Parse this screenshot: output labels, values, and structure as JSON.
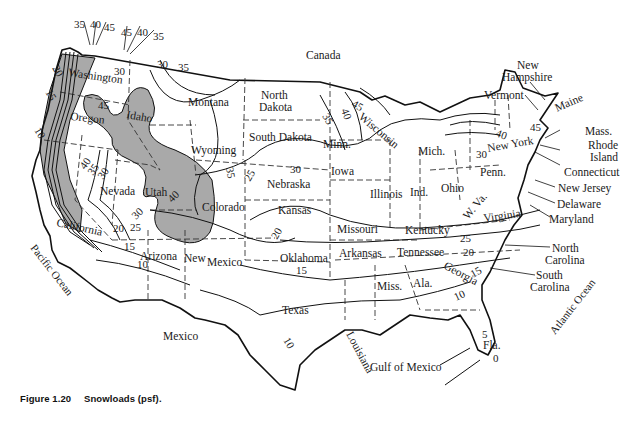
{
  "figure": {
    "number": "Figure 1.20",
    "title": "Snowloads (psf)."
  },
  "map": {
    "type": "contour-map",
    "subject": "Ground snow loads across the contiguous United States",
    "units": "psf",
    "shaded_region_meaning": "high/variable snow load areas (mountains)",
    "colors": {
      "land": "#ffffff",
      "shaded": "#a9a9a9",
      "lines": "#111111"
    },
    "regions": {
      "canada": "Canada",
      "mexico": "Mexico",
      "pacific": "Pacific Ocean",
      "atlantic": "Atlantic Ocean",
      "gulf": "Gulf of Mexico"
    },
    "states": {
      "washington": "Washington",
      "oregon": "Oregon",
      "california": "California",
      "idaho": "Idaho",
      "nevada": "Nevada",
      "utah": "Utah",
      "arizona": "Arizona",
      "montana": "Montana",
      "wyoming": "Wyoming",
      "colorado": "Colorado",
      "new_mexico_1": "New",
      "new_mexico_2": "Mexico",
      "north_dakota_1": "North",
      "north_dakota_2": "Dakota",
      "south_dakota": "South Dakota",
      "nebraska": "Nebraska",
      "kansas": "Kansas",
      "oklahoma": "Oklahoma",
      "texas": "Texas",
      "minn": "Minn.",
      "iowa": "Iowa",
      "missouri": "Missouri",
      "arkansas": "Arkansas",
      "louisiana": "Louisiana",
      "wisconsin": "Wisconsin",
      "illinois": "Illinois",
      "mich": "Mich.",
      "ind": "Ind.",
      "ohio": "Ohio",
      "kentucky": "Kentucky",
      "tennessee": "Tennessee",
      "miss": "Miss.",
      "ala": "Ala.",
      "georgia": "Georgia",
      "fla": "Fla.",
      "w_va": "W. Va.",
      "virginia": "Virginia",
      "penn": "Penn.",
      "new_york": "New York",
      "maine": "Maine",
      "vermont": "Vermont",
      "new_hampshire_1": "New",
      "new_hampshire_2": "Hampshire",
      "mass": "Mass.",
      "rhode_island_1": "Rhode",
      "rhode_island_2": "Island",
      "connecticut": "Connecticut",
      "new_jersey": "New Jersey",
      "delaware": "Delaware",
      "maryland": "Maryland",
      "north_carolina_1": "North",
      "north_carolina_2": "Carolina",
      "south_carolina_1": "South",
      "south_carolina_2": "Carolina"
    },
    "contour_labels": {
      "nw_35a": "35",
      "nw_40a": "40",
      "nw_45a": "45",
      "nw_45b": "45",
      "nw_40b": "40",
      "nw_35b": "35",
      "wa_30": "30",
      "mt_30": "30",
      "mt_35": "35",
      "wa_20": "20",
      "or_15": "15",
      "or_10": "10",
      "or_45": "45",
      "nv_40": "40",
      "nv_35": "35",
      "nv_30": "30",
      "ut_30": "30",
      "ut_40": "40",
      "ca_25": "25",
      "ca_20": "20",
      "az_15": "15",
      "az_10": "10",
      "co_35": "35",
      "ne_25": "25",
      "ia_30": "30",
      "ks_20": "20",
      "ok_15": "15",
      "tx_10": "10",
      "nd_35": "35",
      "wi_40": "40",
      "wi_45": "45",
      "ny_40": "40",
      "ny_45": "45",
      "ny_30": "30",
      "ky_25": "25",
      "tn_20": "20",
      "ga_15": "15",
      "ga_10": "10",
      "fl_5": "5",
      "fl_0": "0"
    },
    "contour_values_psf": [
      0,
      5,
      10,
      15,
      20,
      25,
      30,
      35,
      40,
      45
    ]
  }
}
